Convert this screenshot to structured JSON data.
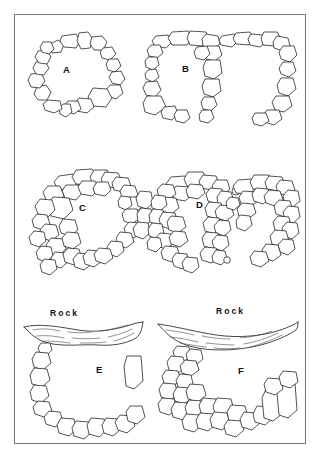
{
  "figure": {
    "background_color": "#ffffff",
    "frame": {
      "x": 14,
      "y": 14,
      "width": 291,
      "height": 429,
      "stroke_color": "#7d7d7d"
    },
    "stone_stroke_color": "#1a1a1a",
    "stone_fill_color": "#ffffff",
    "rock_hatch_color": "#4a4a4a"
  },
  "panels": [
    {
      "id": "panel-a",
      "label": "A",
      "label_x": 63,
      "label_y": 73,
      "description": "single circular ring of stones",
      "rock_label": null
    },
    {
      "id": "panel-b",
      "label": "B",
      "label_x": 182,
      "label_y": 72,
      "description": "double adjoining U-shaped stone enclosures",
      "rock_label": null
    },
    {
      "id": "panel-c",
      "label": "C",
      "label_x": 79,
      "label_y": 211,
      "description": "thick multi-course C-shaped ring open at base",
      "rock_label": null
    },
    {
      "id": "panel-d",
      "label": "D",
      "label_x": 196,
      "label_y": 208,
      "description": "double chamber structure with thick rubble walls",
      "rock_label": null
    },
    {
      "id": "panel-e",
      "label": "E",
      "label_x": 96,
      "label_y": 373,
      "description": "stone arc built against a rock overhang",
      "rock_label": "Rock",
      "rock_label_x": 50,
      "rock_label_y": 316
    },
    {
      "id": "panel-f",
      "label": "F",
      "label_x": 238,
      "label_y": 374,
      "description": "dense stone cluster built against a rock overhang",
      "rock_label": "Rock",
      "rock_label_x": 216,
      "rock_label_y": 314
    }
  ],
  "chart_data": {
    "type": "diagram",
    "title": "",
    "panel_ids": [
      "A",
      "B",
      "C",
      "D",
      "E",
      "F"
    ],
    "rock_labels": [
      "Rock",
      "Rock"
    ]
  }
}
